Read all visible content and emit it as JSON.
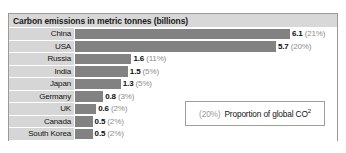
{
  "chart_data": {
    "type": "bar",
    "title": "Carbon emissions in metric tonnes (billions)",
    "xlabel": "",
    "ylabel": "",
    "orientation": "horizontal",
    "grid": false,
    "xlim": [
      0,
      6.1
    ],
    "legend_position": "inside-bottom-right",
    "categories": [
      "China",
      "USA",
      "Russia",
      "India",
      "Japan",
      "Germany",
      "UK",
      "Canada",
      "South Korea"
    ],
    "values": [
      6.1,
      5.7,
      1.6,
      1.5,
      1.3,
      0.8,
      0.6,
      0.5,
      0.5
    ],
    "value_labels": [
      "6.1",
      "5.7",
      "1.6",
      "1.5",
      "1.3",
      "0.8",
      "0.6",
      "0.5",
      "0.5"
    ],
    "percent_labels": [
      "(21%)",
      "(20%)",
      "(11%)",
      "(5%)",
      "(5%)",
      "(3%)",
      "(2%)",
      "(2%)",
      "(2%)"
    ],
    "percent_values": [
      21,
      20,
      11,
      5,
      5,
      3,
      2,
      2,
      2
    ],
    "annotation": {
      "percent_sample": "(20%)",
      "description": "Proportion of global CO",
      "superscript": "2"
    },
    "colors": {
      "bar": "#828282",
      "label_background": "#d6d6d6",
      "title_background": "#d8d8d8",
      "value_text": "#0d0d0d",
      "percent_text": "#8d8d8d",
      "frame_border": "#9a9a9a"
    }
  },
  "rows": [
    {
      "label": "China",
      "value": "6.1",
      "pct": "(21%)"
    },
    {
      "label": "USA",
      "value": "5.7",
      "pct": "(20%)"
    },
    {
      "label": "Russia",
      "value": "1.6",
      "pct": "(11%)"
    },
    {
      "label": "India",
      "value": "1.5",
      "pct": "(5%)"
    },
    {
      "label": "Japan",
      "value": "1.3",
      "pct": "(5%)"
    },
    {
      "label": "Germany",
      "value": "0.8",
      "pct": "(3%)"
    },
    {
      "label": "UK",
      "value": "0.6",
      "pct": "(2%)"
    },
    {
      "label": "Canada",
      "value": "0.5",
      "pct": "(2%)"
    },
    {
      "label": "South Korea",
      "value": "0.5",
      "pct": "(2%)"
    }
  ],
  "legend": {
    "percent": "(20%)",
    "text": "Proportion of global CO",
    "superscript": "2"
  }
}
